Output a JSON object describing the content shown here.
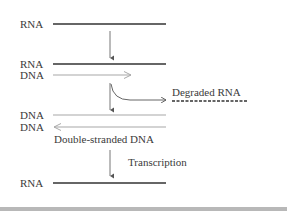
{
  "diagram": {
    "labels": {
      "rna_1": "RNA",
      "rna_2": "RNA",
      "dna_1": "DNA",
      "dna_2": "DNA",
      "dna_3": "DNA",
      "rna_final": "RNA",
      "degraded_rna": "Degraded RNA",
      "double_stranded_dna": "Double-stranded DNA",
      "transcription": "Transcription"
    },
    "colors": {
      "rna_strand": "#333333",
      "dna_strand": "#a8a8a8",
      "arrow": "#555555",
      "bottom_bar": "#b8b8b8"
    }
  }
}
